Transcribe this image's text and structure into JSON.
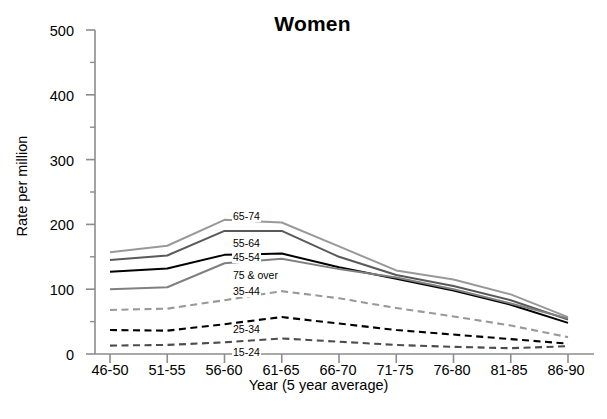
{
  "chart_data": {
    "type": "line",
    "title": "Women",
    "xlabel": "Year (5 year average)",
    "ylabel": "Rate per million",
    "categories": [
      "46-50",
      "51-55",
      "56-60",
      "61-65",
      "66-70",
      "71-75",
      "76-80",
      "81-85",
      "86-90"
    ],
    "ylim": [
      0,
      500
    ],
    "yticks": [
      0,
      100,
      200,
      300,
      400,
      500
    ],
    "yticks_minor": [
      50,
      150,
      250,
      350,
      450
    ],
    "grid": false,
    "legend_position": "inline-annotations",
    "series": [
      {
        "name": "65-74",
        "style": "solid",
        "color": "#999999",
        "values": [
          157,
          167,
          207,
          203,
          166,
          129,
          115,
          92,
          57
        ]
      },
      {
        "name": "55-64",
        "style": "solid",
        "color": "#595959",
        "values": [
          145,
          152,
          190,
          190,
          150,
          122,
          105,
          83,
          53
        ]
      },
      {
        "name": "45-54",
        "style": "solid",
        "color": "#000000",
        "values": [
          127,
          132,
          153,
          155,
          134,
          116,
          98,
          76,
          48
        ]
      },
      {
        "name": "75 & over",
        "style": "solid",
        "color": "#808080",
        "values": [
          100,
          103,
          140,
          147,
          131,
          118,
          100,
          78,
          55
        ]
      },
      {
        "name": "35-44",
        "style": "dashed",
        "color": "#999999",
        "values": [
          68,
          70,
          83,
          97,
          86,
          71,
          58,
          44,
          26
        ]
      },
      {
        "name": "25-34",
        "style": "dashed",
        "color": "#000000",
        "values": [
          37,
          36,
          46,
          57,
          47,
          37,
          30,
          23,
          16
        ]
      },
      {
        "name": "15-24",
        "style": "dashed",
        "color": "#4d4d4d",
        "values": [
          13,
          14,
          18,
          24,
          19,
          14,
          11,
          9,
          12
        ]
      }
    ],
    "annotations": [
      {
        "text": "65-74",
        "x": 232,
        "y": 211
      },
      {
        "text": "55-64",
        "x": 232,
        "y": 238
      },
      {
        "text": "45-54",
        "x": 232,
        "y": 252
      },
      {
        "text": "75 & over",
        "x": 232,
        "y": 270
      },
      {
        "text": "35-44",
        "x": 232,
        "y": 286
      },
      {
        "text": "25-34",
        "x": 232,
        "y": 324
      },
      {
        "text": "15-24",
        "x": 232,
        "y": 347
      }
    ]
  },
  "axis": {
    "y_tick_labels": [
      "500",
      "400",
      "300",
      "200",
      "100",
      "0"
    ],
    "x_tick_labels": [
      "46-50",
      "51-55",
      "56-60",
      "61-65",
      "66-70",
      "71-75",
      "76-80",
      "81-85",
      "86-90"
    ]
  }
}
